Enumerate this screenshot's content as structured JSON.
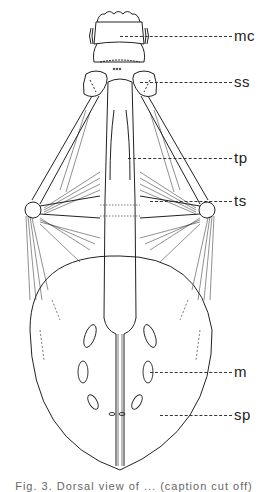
{
  "figure": {
    "type": "anatomical line drawing",
    "labels": [
      {
        "id": "mc",
        "text": "mc",
        "y": 36,
        "leader_from_x": 120
      },
      {
        "id": "ss",
        "text": "ss",
        "y": 82,
        "leader_from_x": 140
      },
      {
        "id": "tp",
        "text": "tp",
        "y": 158,
        "leader_from_x": 128
      },
      {
        "id": "ts",
        "text": "ts",
        "y": 201,
        "leader_from_x": 150
      },
      {
        "id": "m",
        "text": "m",
        "y": 372,
        "leader_from_x": 150
      },
      {
        "id": "sp",
        "text": "sp",
        "y": 415,
        "leader_from_x": 160
      }
    ],
    "caption": "Fig. 3. Dorsal view of ... (caption cut off)"
  }
}
